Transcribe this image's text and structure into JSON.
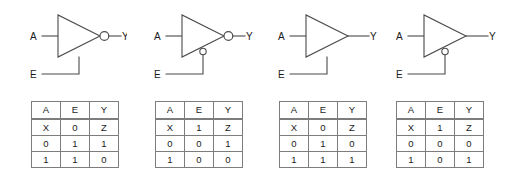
{
  "figure": {
    "background_color": "#ffffff",
    "line_color": "#4a4a4a",
    "text_color": "#1a1a1a",
    "table_border_color": "#7d7d7d"
  },
  "gates": [
    {
      "id": "gate-1",
      "symbol": "inverting-tristate-buffer-active-high-enable",
      "input_label": "A",
      "enable_label": "E",
      "output_label": "Y",
      "output_bubble": true,
      "enable_bubble": false,
      "table": {
        "headers": [
          "A",
          "E",
          "Y"
        ],
        "rows": [
          [
            "X",
            "0",
            "Z"
          ],
          [
            "0",
            "1",
            "1"
          ],
          [
            "1",
            "1",
            "0"
          ]
        ]
      }
    },
    {
      "id": "gate-2",
      "symbol": "inverting-tristate-buffer-active-low-enable",
      "input_label": "A",
      "enable_label": "E",
      "output_label": "Y",
      "output_bubble": true,
      "enable_bubble": true,
      "table": {
        "headers": [
          "A",
          "E",
          "Y"
        ],
        "rows": [
          [
            "X",
            "1",
            "Z"
          ],
          [
            "0",
            "0",
            "1"
          ],
          [
            "1",
            "0",
            "0"
          ]
        ]
      }
    },
    {
      "id": "gate-3",
      "symbol": "noninverting-tristate-buffer-active-high-enable",
      "input_label": "A",
      "enable_label": "E",
      "output_label": "Y",
      "output_bubble": false,
      "enable_bubble": false,
      "table": {
        "headers": [
          "A",
          "E",
          "Y"
        ],
        "rows": [
          [
            "X",
            "0",
            "Z"
          ],
          [
            "0",
            "1",
            "0"
          ],
          [
            "1",
            "1",
            "1"
          ]
        ]
      }
    },
    {
      "id": "gate-4",
      "symbol": "noninverting-tristate-buffer-active-low-enable",
      "input_label": "A",
      "enable_label": "E",
      "output_label": "Y",
      "output_bubble": false,
      "enable_bubble": true,
      "table": {
        "headers": [
          "A",
          "E",
          "Y"
        ],
        "rows": [
          [
            "X",
            "1",
            "Z"
          ],
          [
            "0",
            "0",
            "0"
          ],
          [
            "1",
            "0",
            "1"
          ]
        ]
      }
    }
  ]
}
